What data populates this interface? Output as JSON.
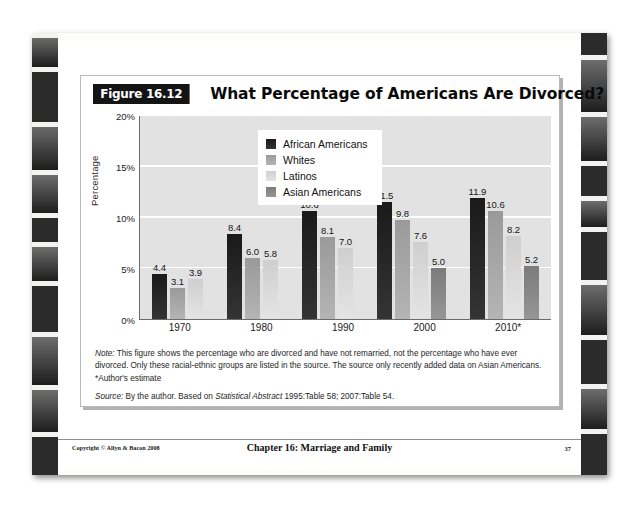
{
  "figure": {
    "badge": "Figure 16.12",
    "title": "What Percentage of Americans Are Divorced?"
  },
  "chart_data": {
    "type": "bar",
    "title": "What Percentage of Americans Are Divorced?",
    "xlabel": "",
    "ylabel": "Percentage",
    "ylim": [
      0,
      20
    ],
    "ytick_labels": [
      "0%",
      "5%",
      "10%",
      "15%",
      "20%"
    ],
    "ytick_values": [
      0,
      5,
      10,
      15,
      20
    ],
    "grid": true,
    "legend_position": "upper-left-inside",
    "categories": [
      "1970",
      "1980",
      "1990",
      "2000",
      "2010*"
    ],
    "series": [
      {
        "name": "African Americans",
        "color": "#262626",
        "values": [
          4.4,
          8.4,
          10.6,
          11.5,
          11.9
        ]
      },
      {
        "name": "Whites",
        "color": "#a8a8a8",
        "values": [
          3.1,
          6.0,
          8.1,
          9.8,
          10.6
        ]
      },
      {
        "name": "Latinos",
        "color": "#d8d8d8",
        "values": [
          3.9,
          5.8,
          7.0,
          7.6,
          8.2
        ]
      },
      {
        "name": "Asian Americans",
        "color": "#888888",
        "values": [
          null,
          null,
          null,
          5.0,
          5.2
        ]
      }
    ],
    "value_labels": {
      "1970": [
        "4.4",
        "3.1",
        "3.9"
      ],
      "1980": [
        "8.4",
        "6.0",
        "5.8"
      ],
      "1990": [
        "10.6",
        "8.1",
        "7.0"
      ],
      "2000": [
        "11.5",
        "9.8",
        "7.6",
        "5.0"
      ],
      "2010*": [
        "11.9",
        "10.6",
        "8.2",
        "5.2"
      ]
    }
  },
  "notes": {
    "note_prefix": "Note:",
    "note_body": " This figure shows the percentage who are divorced and have not remarried, not the percentage who have ever divorced. Only these racial-ethnic groups are listed in the source. The source only recently added data on Asian Americans. *Author's estimate",
    "source_prefix": "Source:",
    "source_part1": " By the author. Based on ",
    "source_italic": "Statistical Abstract",
    "source_part2": " 1995:Table 58; 2007:Table 54."
  },
  "footer": {
    "copyright": "Copyright © Allyn & Bacon 2008",
    "chapter": "Chapter 16: Marriage and Family",
    "page_number": "37"
  }
}
